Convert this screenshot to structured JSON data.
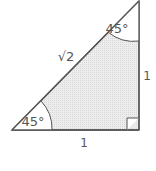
{
  "diagram": {
    "type": "right-isosceles-triangle",
    "angles": {
      "bottom_left": "45°",
      "top": "45°",
      "right_angle_marker": true
    },
    "sides": {
      "hypotenuse": "√2",
      "vertical_leg": "1",
      "horizontal_leg": "1"
    },
    "colors": {
      "stroke": "#555555",
      "fill": "#e6e6e6",
      "text": "#555555"
    }
  }
}
